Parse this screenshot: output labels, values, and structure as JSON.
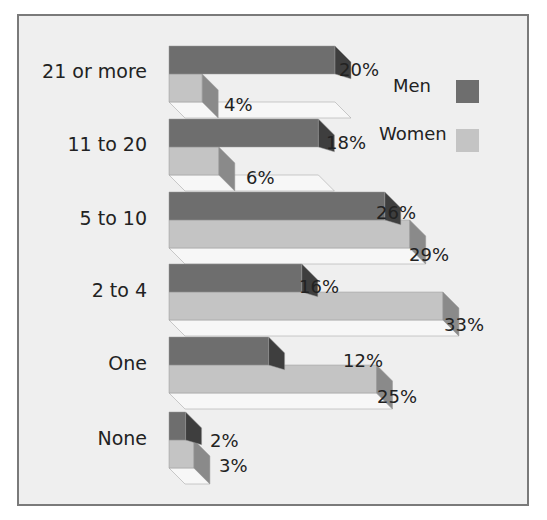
{
  "chart_data": {
    "type": "bar",
    "orientation": "horizontal",
    "style": "3d",
    "title": "",
    "xlabel": "",
    "ylabel": "",
    "categories": [
      "21 or more",
      "11 to 20",
      "5 to 10",
      "2 to 4",
      "One",
      "None"
    ],
    "series": [
      {
        "name": "Men",
        "color": "#6e6e6e",
        "values": [
          20,
          18,
          26,
          16,
          12,
          2
        ]
      },
      {
        "name": "Women",
        "color": "#c4c4c4",
        "values": [
          4,
          6,
          29,
          33,
          25,
          3
        ]
      }
    ],
    "value_labels": {
      "Men": [
        "20%",
        "18%",
        "26%",
        "16%",
        "12%",
        "2%"
      ],
      "Women": [
        "4%",
        "6%",
        "29%",
        "33%",
        "25%",
        "3%"
      ]
    },
    "grid": false,
    "legend_position": "top-right",
    "xlim": [
      0,
      35
    ]
  },
  "legend": {
    "items": [
      {
        "label": "Men",
        "color": "#6e6e6e"
      },
      {
        "label": "Women",
        "color": "#c4c4c4"
      }
    ]
  },
  "colors": {
    "frame_border": "#7a7a7a",
    "background": "#efefef",
    "men_face": "#6e6e6e",
    "men_side": "#3e3e3e",
    "women_face": "#c4c4c4",
    "women_side": "#8a8a8a",
    "floor": "#f7f7f7"
  }
}
